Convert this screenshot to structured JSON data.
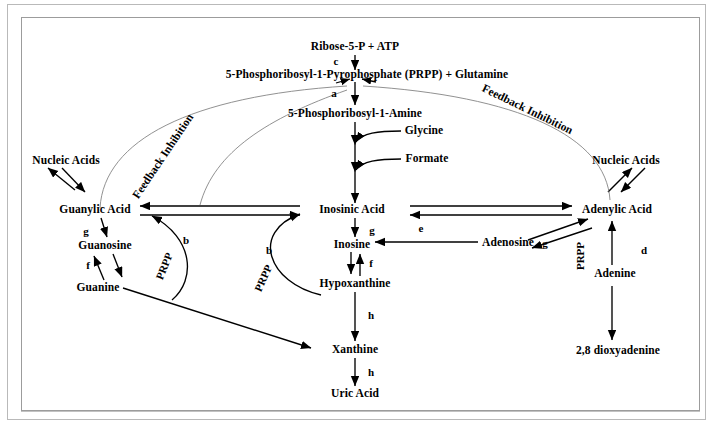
{
  "diagram": {
    "nodes": {
      "ribose": "Ribose-5-P + ATP",
      "prpp_glutamine": "5-Phosphoribosyl-1-Pyrophosphate (PRPP) + Glutamine",
      "phosphoribosylamine": "5-Phosphoribosyl-1-Amine",
      "glycine": "Glycine",
      "formate": "Formate",
      "inosinic_acid": "Inosinic Acid",
      "inosine": "Inosine",
      "hypoxanthine": "Hypoxanthine",
      "xanthine": "Xanthine",
      "uric_acid": "Uric Acid",
      "nucleic_acids_left": "Nucleic Acids",
      "guanylic_acid": "Guanylic Acid",
      "guanosine": "Guanosine",
      "guanine": "Guanine",
      "nucleic_acids_right": "Nucleic Acids",
      "adenylic_acid": "Adenylic Acid",
      "adenosine": "Adenosine",
      "adenine": "Adenine",
      "dioxyadenine": "2,8 dioxyadenine"
    },
    "enzyme_labels": {
      "c": "c",
      "a": "a",
      "g_guanosine": "g",
      "f_guanine": "f",
      "b_left": "b",
      "b_center": "b",
      "g_inosine": "g",
      "f_hypoxanthine": "f",
      "e_adenosine": "e",
      "g_adenosine": "g",
      "d_adenine": "d",
      "h_xanthine": "h",
      "h_uric": "h"
    },
    "cofactor_labels": {
      "prpp_left": "PRPP",
      "prpp_center": "PRPP",
      "prpp_right": "PRPP"
    },
    "feedback_labels": {
      "left": "Feedback Inhibition",
      "right": "Feedback Inhibition"
    },
    "colors": {
      "stroke": "#000000",
      "feedback_stroke": "#595959",
      "frame": "#b9b9b9",
      "background": "#ffffff"
    }
  }
}
